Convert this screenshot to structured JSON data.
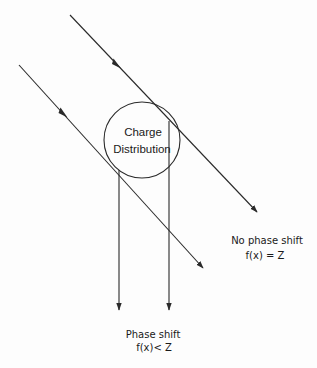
{
  "diagram": {
    "type": "scattering-phase-shift",
    "colors": {
      "line": "#2a2a2a",
      "text": "#1a1a1a",
      "background": "#fdfdfd"
    },
    "circle": {
      "label_line1": "Charge",
      "label_line2": "Distribution",
      "center": [
        142,
        140
      ],
      "radius": 38
    },
    "rays": [
      {
        "name": "upper-incident-ray",
        "from": [
          70,
          15
        ],
        "to": [
          257,
          212
        ],
        "mid_arrow": [
          117,
          65
        ],
        "end_arrow": true
      },
      {
        "name": "lower-incident-ray",
        "from": [
          19,
          65
        ],
        "to": [
          203,
          268
        ],
        "mid_arrow": [
          64,
          114
        ],
        "end_arrow": true
      },
      {
        "name": "left-scattered-ray",
        "from": [
          119,
          175
        ],
        "to": [
          119,
          310
        ],
        "end_arrow": true
      },
      {
        "name": "right-scattered-ray",
        "from": [
          169,
          121
        ],
        "to": [
          169,
          310
        ],
        "end_arrow": true
      }
    ],
    "labels": {
      "no_shift_title": "No phase shift",
      "no_shift_eq": "f(x) = Z",
      "shift_title": "Phase shift",
      "shift_eq": "f(x)< Z"
    }
  }
}
